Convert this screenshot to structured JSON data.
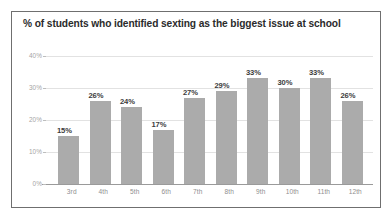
{
  "chart_data": {
    "type": "bar",
    "title": "% of students who identified sexting as the biggest issue at school",
    "xlabel": "",
    "ylabel": "",
    "categories": [
      "3rd",
      "4th",
      "5th",
      "6th",
      "7th",
      "8th",
      "9th",
      "10th",
      "11th",
      "12th"
    ],
    "values": [
      15,
      26,
      24,
      17,
      27,
      29,
      33,
      30,
      33,
      26
    ],
    "value_labels": [
      "15%",
      "26%",
      "24%",
      "17%",
      "27%",
      "29%",
      "33%",
      "30%",
      "33%",
      "26%"
    ],
    "ylim": [
      0,
      40
    ],
    "yticks": [
      0,
      10,
      20,
      30,
      40
    ],
    "ytick_labels": [
      "0%",
      "10%",
      "20%",
      "30%",
      "40%"
    ],
    "grid": true,
    "legend": "none",
    "bar_color": "#ababab",
    "gridline_color": "#e2e2e2",
    "axis_color": "#9a9a9a",
    "title_color": "#2b2b2b",
    "tick_label_color": "#a4a4a4",
    "value_label_color": "#3c3c3c",
    "border_color": "#6f6f6f",
    "background_color": "#ffffff"
  }
}
